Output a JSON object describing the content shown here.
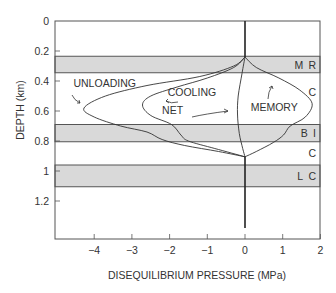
{
  "chart_data": {
    "type": "line",
    "title": "",
    "xlabel": "DISEQUILIBRIUM PRESSURE (MPa)",
    "ylabel": "DEPTH (km)",
    "xlim": [
      -5.05,
      2.0
    ],
    "ylim": [
      0,
      1.45
    ],
    "y_inverted": true,
    "grid": false,
    "x_ticks": [
      -4,
      -3,
      -2,
      -1,
      0,
      1,
      2
    ],
    "x_tick_labels": [
      "−4",
      "−3",
      "−2",
      "−1",
      "0",
      "1",
      "2"
    ],
    "y_ticks": [
      0,
      0.2,
      0.4,
      0.6,
      0.8,
      1.0,
      1.2
    ],
    "y_tick_labels": [
      "0",
      "0.2",
      "0.4",
      "0.6",
      "0.8",
      "1",
      "1.2"
    ],
    "bands": [
      {
        "depth_top": 0.235,
        "depth_bottom": 0.345,
        "label": "M R"
      },
      {
        "depth_top": 0.69,
        "depth_bottom": 0.805,
        "label": "B I"
      },
      {
        "depth_top": 0.96,
        "depth_bottom": 1.105,
        "label": "L C"
      }
    ],
    "unshaded_labels": [
      {
        "depth": 0.47,
        "label": "C"
      },
      {
        "depth": 0.88,
        "label": "C"
      }
    ],
    "series": [
      {
        "name": "UNLOADING",
        "points": [
          [
            0,
            0.24
          ],
          [
            -0.3,
            0.3
          ],
          [
            -1.2,
            0.37
          ],
          [
            -2.6,
            0.43
          ],
          [
            -3.7,
            0.5
          ],
          [
            -4.27,
            0.58
          ],
          [
            -4.0,
            0.64
          ],
          [
            -3.3,
            0.7
          ],
          [
            -2.6,
            0.74
          ],
          [
            -2.2,
            0.79
          ],
          [
            -1.6,
            0.83
          ],
          [
            -0.7,
            0.87
          ],
          [
            0,
            0.905
          ]
        ]
      },
      {
        "name": "COOLING",
        "points": [
          [
            0,
            0.24
          ],
          [
            -0.3,
            0.31
          ],
          [
            -1.0,
            0.38
          ],
          [
            -1.8,
            0.44
          ],
          [
            -2.5,
            0.5
          ],
          [
            -2.72,
            0.56
          ],
          [
            -2.5,
            0.63
          ],
          [
            -1.95,
            0.69
          ],
          [
            -1.7,
            0.76
          ],
          [
            -1.5,
            0.8
          ],
          [
            -0.8,
            0.85
          ],
          [
            0,
            0.905
          ]
        ]
      },
      {
        "name": "NET",
        "points": [
          [
            0,
            0.24
          ],
          [
            -0.08,
            0.35
          ],
          [
            -0.18,
            0.5
          ],
          [
            -0.2,
            0.62
          ],
          [
            -0.15,
            0.75
          ],
          [
            -0.06,
            0.85
          ],
          [
            0,
            0.905
          ]
        ]
      },
      {
        "name": "MEMORY",
        "points": [
          [
            0,
            0.24
          ],
          [
            0.3,
            0.31
          ],
          [
            0.9,
            0.38
          ],
          [
            1.45,
            0.46
          ],
          [
            1.78,
            0.55
          ],
          [
            1.6,
            0.64
          ],
          [
            1.2,
            0.7
          ],
          [
            1.02,
            0.76
          ],
          [
            0.75,
            0.81
          ],
          [
            0.3,
            0.87
          ],
          [
            0,
            0.905
          ]
        ]
      },
      {
        "name": "ZERO_LINE",
        "segments": [
          [
            [
              0,
              0
            ],
            [
              0,
              0.24
            ]
          ],
          [
            [
              0,
              0.905
            ],
            [
              0,
              1.38
            ]
          ]
        ]
      }
    ],
    "annotations": [
      {
        "text": "UNLOADING",
        "p": -4.55,
        "d": 0.44
      },
      {
        "text": "COOLING",
        "p": -2.05,
        "d": 0.5
      },
      {
        "text": "NET",
        "p": -2.2,
        "d": 0.62
      },
      {
        "text": "MEMORY",
        "p": 0.15,
        "d": 0.6
      }
    ]
  }
}
